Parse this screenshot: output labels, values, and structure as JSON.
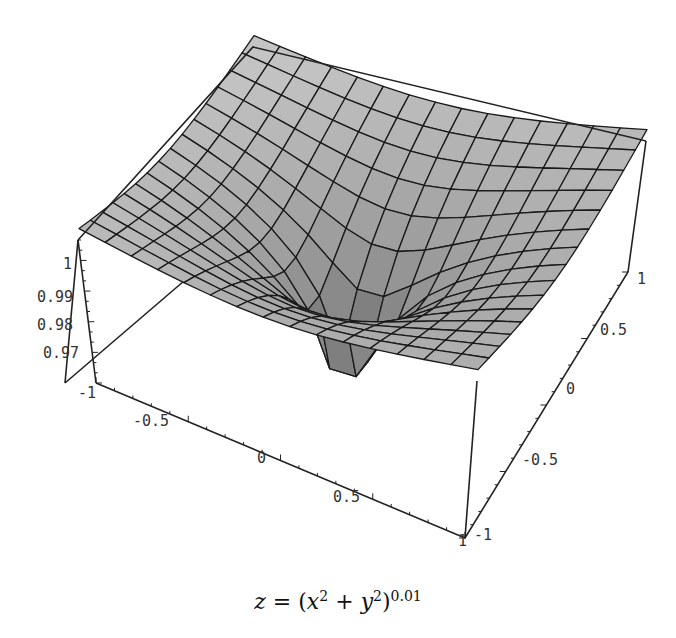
{
  "chart_data": {
    "type": "surface3d",
    "title": "",
    "caption": {
      "lhs": "z",
      "eq": "=",
      "open": "(",
      "x": "x",
      "plus": "+",
      "y": "y",
      "sq": "2",
      "close": ")",
      "exponent": "0.01"
    },
    "function": "z = (x^2 + y^2)^0.01",
    "x_range": [
      -1,
      1
    ],
    "y_range": [
      -1,
      1
    ],
    "z_range": [
      0.96,
      1.0035
    ],
    "mesh_divisions": 15,
    "exponent": 0.01,
    "x_ticks": [
      "-1",
      "-0.5",
      "0",
      "0.5",
      "1"
    ],
    "y_ticks": [
      "-1",
      "-0.5",
      "0",
      "0.5",
      "1"
    ],
    "z_ticks": [
      "0.97",
      "0.98",
      "0.99",
      "1"
    ],
    "surface_color": "#b4b4b4",
    "mesh_color": "#1a1a1a",
    "box_color": "#222222",
    "boxed": true,
    "grid": false
  }
}
